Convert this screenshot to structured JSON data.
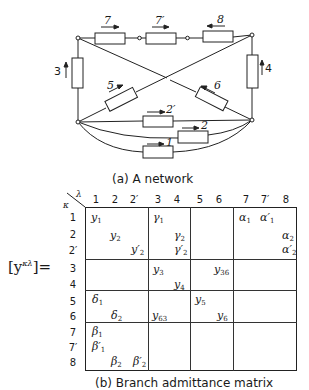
{
  "network": {
    "caption": "(a)  A network",
    "branches": [
      {
        "id": "1",
        "label": "1"
      },
      {
        "id": "2",
        "label": "2"
      },
      {
        "id": "2p",
        "label": "2′"
      },
      {
        "id": "3",
        "label": "3"
      },
      {
        "id": "4",
        "label": "4"
      },
      {
        "id": "5",
        "label": "5"
      },
      {
        "id": "6",
        "label": "6"
      },
      {
        "id": "7",
        "label": "7"
      },
      {
        "id": "7p",
        "label": "7′"
      },
      {
        "id": "8",
        "label": "8"
      }
    ]
  },
  "matrix": {
    "lhs": "[y",
    "lhs_sup": "κλ",
    "lhs_end": "]=",
    "corner_row": "κ",
    "corner_col": "λ",
    "col_headers": [
      "1",
      "2",
      "2′",
      "3",
      "4",
      "5",
      "6",
      "7",
      "7′",
      "8"
    ],
    "row_headers": [
      "1",
      "2",
      "2′",
      "3",
      "4",
      "5",
      "6",
      "7",
      "7′",
      "8"
    ],
    "entries": {
      "y1": {
        "base": "y",
        "sub": "1"
      },
      "y2": {
        "base": "y",
        "sub": "2"
      },
      "y2p": {
        "base": "y′",
        "sub": "2"
      },
      "gamma1": {
        "base": "γ",
        "sub": "1"
      },
      "gamma2": {
        "base": "γ",
        "sub": "2"
      },
      "gamma2p": {
        "base": "γ′",
        "sub": "2"
      },
      "alpha1": {
        "base": "α",
        "sub": "1"
      },
      "alpha1p": {
        "base": "α′",
        "sub": "1"
      },
      "alpha2": {
        "base": "α",
        "sub": "2"
      },
      "alpha2p": {
        "base": "α′",
        "sub": "2"
      },
      "y3": {
        "base": "y",
        "sub": "3"
      },
      "y4": {
        "base": "y",
        "sub": "4"
      },
      "y36": {
        "base": "y",
        "sub": "36"
      },
      "delta1": {
        "base": "δ",
        "sub": "1"
      },
      "delta2": {
        "base": "δ",
        "sub": "2"
      },
      "y63": {
        "base": "y",
        "sub": "63"
      },
      "y5": {
        "base": "y",
        "sub": "5"
      },
      "y6": {
        "base": "y",
        "sub": "6"
      },
      "beta1": {
        "base": "β",
        "sub": "1"
      },
      "beta1p": {
        "base": "β′",
        "sub": "1"
      },
      "beta2": {
        "base": "β",
        "sub": "2"
      },
      "beta2p": {
        "base": "β′",
        "sub": "2"
      }
    },
    "caption": "(b)  Branch admittance matrix"
  }
}
